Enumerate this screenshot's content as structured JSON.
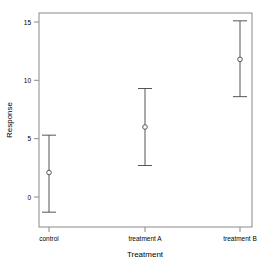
{
  "chart_data": {
    "type": "scatter",
    "title": "",
    "xlabel": "Treatment",
    "ylabel": "Response",
    "categories": [
      "control",
      "treatment A",
      "treatment B"
    ],
    "values": [
      2.1,
      6.0,
      11.8
    ],
    "lower": [
      -1.3,
      2.7,
      8.6
    ],
    "upper": [
      5.3,
      9.3,
      15.1
    ],
    "ylim": [
      -2.3,
      15.8
    ],
    "yticks": [
      0,
      5,
      10,
      15
    ],
    "ytick_labels": [
      "0",
      "5",
      "10",
      "15"
    ],
    "grid": false,
    "legend": "none",
    "marker": "open-circle",
    "errorbar_style": "capped-vertical",
    "series": [
      {
        "name": "Response",
        "points": [
          {
            "category": "control",
            "value": 2.1,
            "lower": -1.3,
            "upper": 5.3
          },
          {
            "category": "treatment A",
            "value": 6.0,
            "lower": 2.7,
            "upper": 9.3
          },
          {
            "category": "treatment B",
            "value": 11.8,
            "lower": 8.6,
            "upper": 15.1
          }
        ]
      }
    ]
  },
  "axes": {
    "y_title": "Response",
    "x_title": "Treatment",
    "y_tick_0": "0",
    "y_tick_1": "5",
    "y_tick_2": "10",
    "y_tick_3": "15",
    "x_tick_0": "control",
    "x_tick_1": "treatment A",
    "x_tick_2": "treatment B"
  },
  "style": {
    "frame_color": "#888888",
    "series_color": "#555555",
    "text_color": "#000000",
    "background": "#ffffff"
  }
}
